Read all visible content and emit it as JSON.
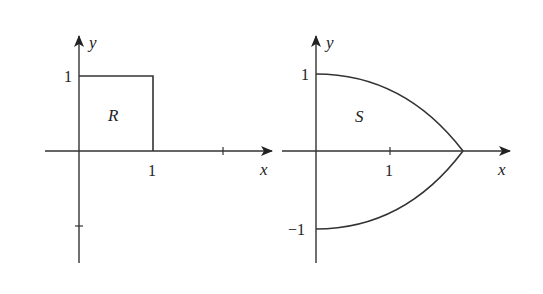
{
  "left_panel": {
    "region_label": "R",
    "x_axis_label": "x",
    "y_axis_label": "y",
    "x_tick_label": "1",
    "y_tick_label": "1"
  },
  "right_panel": {
    "region_label": "S",
    "x_axis_label": "x",
    "y_axis_label": "y",
    "x_tick_label": "1",
    "y_tick_top_label": "1",
    "y_tick_bottom_label": "−1"
  },
  "colors": {
    "stroke": "#333333",
    "text": "#222222",
    "background": "#ffffff"
  }
}
